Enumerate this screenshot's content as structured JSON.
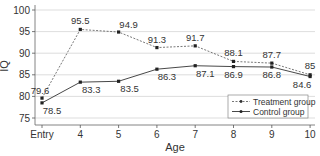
{
  "chart_data": {
    "type": "line",
    "title": "",
    "xlabel": "Age",
    "ylabel": "IQ",
    "categories": [
      "Entry",
      "4",
      "5",
      "6",
      "7",
      "8",
      "9",
      "10"
    ],
    "ylim": [
      73.5,
      101
    ],
    "yticks": [
      75,
      80,
      85,
      90,
      95,
      100
    ],
    "grid": "horizontal",
    "legend_position": "lower right",
    "series": [
      {
        "name": "Treatment group",
        "style": "dashed",
        "color": "#555555",
        "values": [
          79.6,
          95.5,
          94.9,
          91.3,
          91.7,
          88.1,
          87.7,
          85
        ],
        "labels": [
          "79.6",
          "95.5",
          "94.9",
          "91.3",
          "91.7",
          "88.1",
          "87.7",
          "85"
        ]
      },
      {
        "name": "Control group",
        "style": "solid",
        "color": "#333333",
        "values": [
          78.5,
          83.3,
          83.5,
          86.3,
          87.1,
          86.9,
          86.8,
          84.6
        ],
        "labels": [
          "78.5",
          "83.3",
          "83.5",
          "86.3",
          "87.1",
          "86.9",
          "86.8",
          "84.6"
        ]
      }
    ]
  }
}
